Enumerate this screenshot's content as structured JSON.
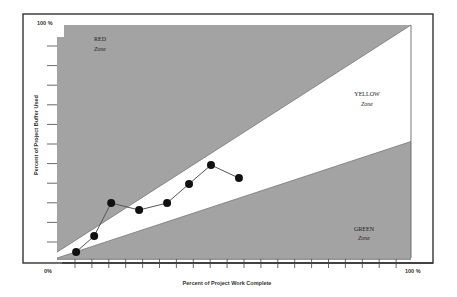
{
  "chart_data": {
    "type": "line",
    "title": "",
    "xlabel": "Percent of Project Work Complete",
    "ylabel": "Percent of Project Buffer Used",
    "x_tick_labels": [
      "0%",
      "100%"
    ],
    "y_tick_labels": [
      "100%"
    ],
    "xlim": [
      0,
      100
    ],
    "ylim": [
      0,
      100
    ],
    "grid": false,
    "legend": null,
    "zones": [
      {
        "name": "RED",
        "label": "Zone",
        "color": "#a0a0a0",
        "boundary_start": [
          0,
          2.5
        ],
        "boundary_end": [
          100,
          100
        ]
      },
      {
        "name": "YELLOW",
        "label": "Zone",
        "color": "#ffffff"
      },
      {
        "name": "GREEN",
        "label": "Zone",
        "color": "#a0a0a0",
        "boundary_start": [
          0,
          0
        ],
        "boundary_end": [
          100,
          50
        ]
      }
    ],
    "series": [
      {
        "name": "Project progress",
        "x": [
          5.4,
          10.5,
          15.3,
          23.2,
          31.1,
          37.3,
          43.5,
          51.4
        ],
        "y": [
          2.6,
          9.4,
          23.6,
          20.6,
          23.6,
          31.8,
          39.9,
          34.3
        ]
      }
    ]
  },
  "labels": {
    "y_top": "100 %",
    "x_zero": "0%",
    "x_end": "100 %",
    "x_axis": "Percent of Project Work Complete",
    "y_axis": "Percent of Project Buffer Used",
    "red_title": "RED",
    "red_sub": "Zone",
    "yellow_title": "YELLOW",
    "yellow_sub": "Zone",
    "green_title": "GREEN",
    "green_sub": "Zone"
  },
  "colors": {
    "zone_fill": "#a3a3a3",
    "frame": "#333333",
    "marker": "#111111",
    "line": "#555555"
  }
}
